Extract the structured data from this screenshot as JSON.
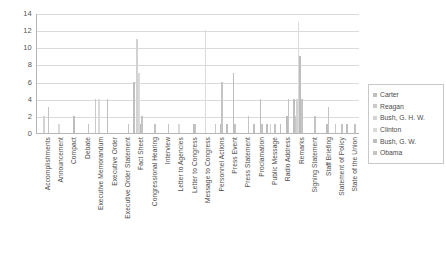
{
  "chart_data": {
    "type": "bar",
    "title": "",
    "xlabel": "",
    "ylabel": "",
    "ylim": [
      0,
      14
    ],
    "ytick_labels": [
      "14",
      "12",
      "10",
      "8",
      "6",
      "4",
      "2",
      "0"
    ],
    "ytick_values": [
      14,
      12,
      10,
      8,
      6,
      4,
      2,
      0
    ],
    "grid": true,
    "legend_position": "right",
    "categories": [
      "Accomplishments",
      "Announcement",
      "Compact",
      "Debate",
      "Executive Memorandum",
      "Executive Order",
      "Executive Order Statement",
      "Fact Sheet",
      "Congressional Hearing",
      "Interview",
      "Letter to Agencies",
      "Letter to Congress",
      "Message to Congress",
      "Personnel Actions",
      "Press Event",
      "Press Statement",
      "Proclamation",
      "Public Message",
      "Radio Address",
      "Remarks",
      "Signing Statement",
      "Staff Briefing",
      "Statement of Policy",
      "State of the Union"
    ],
    "series": [
      {
        "name": "Carter",
        "color": "#bfbfbf",
        "values": [
          0,
          0,
          0,
          0,
          0,
          4,
          0,
          6,
          0,
          0,
          0,
          0,
          0,
          0,
          1,
          0,
          1,
          1,
          1,
          4,
          0,
          0,
          0,
          1
        ]
      },
      {
        "name": "Reagan",
        "color": "#c9c9c9",
        "values": [
          0,
          0,
          0,
          0,
          4,
          0,
          0,
          0,
          0,
          0,
          0,
          0,
          0,
          1,
          0,
          0,
          0,
          0,
          0,
          2,
          0,
          0,
          1,
          0
        ]
      },
      {
        "name": "Bush, G. H. W.",
        "color": "#d2d2d2",
        "values": [
          2,
          0,
          0,
          0,
          0,
          0,
          0,
          11,
          0,
          0,
          0,
          0,
          0,
          0,
          0,
          0,
          0,
          1,
          0,
          4,
          0,
          0,
          0,
          0
        ]
      },
      {
        "name": "Clinton",
        "color": "#dadada",
        "values": [
          0,
          1,
          0,
          0,
          4,
          0,
          0,
          7,
          0,
          0,
          1,
          0,
          12,
          0,
          0,
          0,
          0,
          0,
          0,
          13,
          0,
          0,
          0,
          0
        ]
      },
      {
        "name": "Bush, G. W.",
        "color": "#bdbdbd",
        "values": [
          0,
          0,
          2,
          0,
          0,
          0,
          0,
          1,
          0,
          0,
          0,
          1,
          0,
          1,
          7,
          0,
          4,
          0,
          2,
          9,
          0,
          1,
          0,
          0
        ]
      },
      {
        "name": "Obama",
        "color": "#c4c4c4",
        "values": [
          3,
          0,
          0,
          1,
          0,
          0,
          1,
          2,
          1,
          1,
          0,
          1,
          0,
          6,
          1,
          2,
          1,
          1,
          4,
          4,
          2,
          3,
          1,
          1
        ]
      }
    ]
  },
  "legend": {
    "items": [
      {
        "label": "Carter"
      },
      {
        "label": "Reagan"
      },
      {
        "label": "Bush, G. H. W."
      },
      {
        "label": "Clinton"
      },
      {
        "label": "Bush, G. W."
      },
      {
        "label": "Obama"
      }
    ]
  }
}
